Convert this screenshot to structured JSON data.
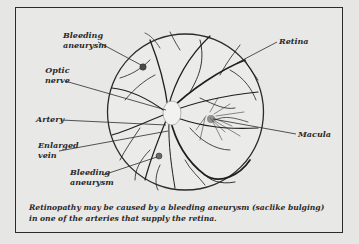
{
  "diagram": {
    "title": "Retinopathy",
    "labels": {
      "bleeding_aneurysm_top": "Bleeding aneurysm",
      "optic_nerve": "Optic nerve",
      "retina": "Retina",
      "artery": "Artery",
      "enlarged_vein": "Enlarged vein",
      "bleeding_aneurysm_bottom": "Bleeding aneurysm",
      "macula": "Macula"
    },
    "label_lines": {
      "bleeding_aneurysm_top": [
        "Bleeding",
        "aneurysm"
      ],
      "optic_nerve": [
        "Optic",
        "nerve"
      ],
      "enlarged_vein": [
        "Enlarged",
        "vein"
      ],
      "bleeding_aneurysm_bottom": [
        "Bleeding",
        "aneurysm"
      ]
    },
    "caption": "Retinopathy may be caused by a bleeding aneurysm (saclike bulging) in one of the arteries that supply the retina.",
    "colors": {
      "background": "#e6e6e4",
      "line": "#2b2b2b",
      "vessel": "#1e1e1e"
    }
  }
}
